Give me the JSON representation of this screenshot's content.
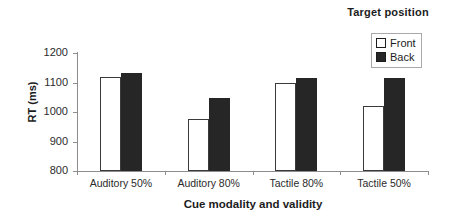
{
  "chart_data": {
    "type": "bar",
    "title": "",
    "xlabel": "Cue modality and validity",
    "ylabel": "RT (ms)",
    "categories": [
      "Auditory 50%",
      "Auditory 80%",
      "Tactile 80%",
      "Tactile 50%"
    ],
    "series": [
      {
        "name": "Front",
        "values": [
          1118,
          977,
          1097,
          1020
        ],
        "color": "#ffffff"
      },
      {
        "name": "Back",
        "values": [
          1132,
          1049,
          1114,
          1117
        ],
        "color": "#262626"
      }
    ],
    "ylim": [
      800,
      1200
    ],
    "yticks": [
      800,
      900,
      1000,
      1100,
      1200
    ],
    "ytick_labels": [
      "800",
      "900",
      "1000",
      "1100",
      "1200"
    ],
    "grid": false,
    "legend": {
      "title": "Target position",
      "position": "top-right",
      "entries": [
        {
          "label": "Front",
          "swatch": "white-square"
        },
        {
          "label": "Back",
          "swatch": "black-square"
        }
      ]
    }
  }
}
